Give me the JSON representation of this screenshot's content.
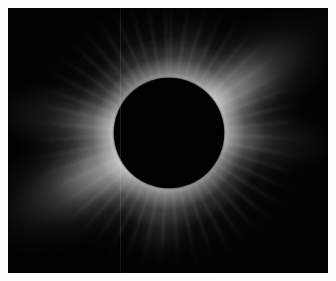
{
  "image": {
    "subject": "total-solar-eclipse",
    "title": "Total Solar Eclipse — Solar Corona",
    "medium": "photographic plate",
    "alt_text": "Black lunar disk silhouetted against the bright white solar corona during totality",
    "width_px": 336,
    "height_px": 281
  },
  "frame": {
    "border_color": "#fdfdfb",
    "border_width_px": 8,
    "plate_background": "#020202"
  },
  "occulting_body": {
    "name": "moon-disk",
    "label": "Lunar silhouette",
    "color": "#000000",
    "center_x_pct": 50.3,
    "center_y_pct": 47.3,
    "radius_px": 55
  },
  "corona": {
    "label": "Solar corona",
    "core_color": "#ffffff",
    "mid_color": "#c8c8c4",
    "falloff_color": "#3a3a39",
    "sky_color": "#020202",
    "streamers": [
      {
        "name": "northeast-streamer",
        "label": "NE streamer",
        "angle_deg": -34,
        "length_px": 240,
        "intensity": "bright"
      },
      {
        "name": "southwest-streamer",
        "label": "SW streamer",
        "angle_deg": 152,
        "length_px": 250,
        "intensity": "bright"
      },
      {
        "name": "west-equatorial-fan",
        "label": "W equatorial fan",
        "angle_deg": 188,
        "length_px": 190,
        "intensity": "medium"
      },
      {
        "name": "east-equatorial-fan",
        "label": "E equatorial fan",
        "angle_deg": 4,
        "length_px": 175,
        "intensity": "medium"
      },
      {
        "name": "north-polar-brush",
        "label": "N polar brush",
        "angle_deg": -76,
        "length_px": 118,
        "intensity": "faint"
      },
      {
        "name": "south-polar-brush",
        "label": "S polar brush",
        "angle_deg": 96,
        "length_px": 128,
        "intensity": "faint"
      }
    ]
  },
  "artifacts": {
    "scan_seam_x_px": 112,
    "grain": "film-grain",
    "vignette": "corner-falloff"
  }
}
